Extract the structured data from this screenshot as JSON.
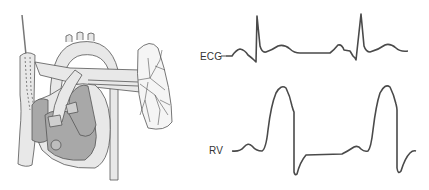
{
  "figure": {
    "labels": {
      "ecg": "ECG",
      "rv": "RV"
    },
    "colors": {
      "trace": "#4a4a4a",
      "vessel_fill": "#e6e6e6",
      "chamber_fill": "#a8a8a8",
      "outline": "#555555"
    },
    "traces": [
      {
        "name": "ECG",
        "beats": 2
      },
      {
        "name": "RV",
        "beats": 2
      }
    ]
  }
}
